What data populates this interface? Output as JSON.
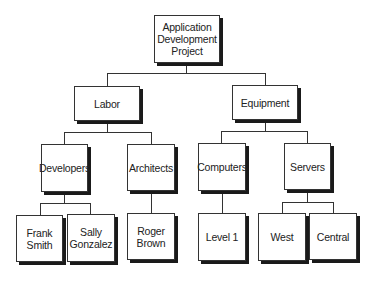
{
  "diagram": {
    "type": "org-chart",
    "root": {
      "label": "Application\nDevelopment\nProject",
      "children": [
        {
          "label": "Labor",
          "children": [
            {
              "label": "Developers",
              "children": [
                {
                  "label": "Frank\nSmith"
                },
                {
                  "label": "Sally\nGonzalez"
                }
              ]
            },
            {
              "label": "Architects",
              "children": [
                {
                  "label": "Roger\nBrown"
                }
              ]
            }
          ]
        },
        {
          "label": "Equipment",
          "children": [
            {
              "label": "Computers",
              "children": [
                {
                  "label": "Level 1"
                }
              ]
            },
            {
              "label": "Servers",
              "children": [
                {
                  "label": "West"
                },
                {
                  "label": "Central"
                }
              ]
            }
          ]
        }
      ]
    },
    "nodes": {
      "root": "Application\nDevelopment\nProject",
      "labor": "Labor",
      "equipment": "Equipment",
      "developers": "Developers",
      "architects": "Architects",
      "computers": "Computers",
      "servers": "Servers",
      "frank_smith": "Frank\nSmith",
      "sally_gonzalez": "Sally\nGonzalez",
      "roger_brown": "Roger\nBrown",
      "level1": "Level 1",
      "west": "West",
      "central": "Central"
    },
    "colors": {
      "border": "#333333",
      "shadow": "#1a1a1a",
      "background": "#ffffff",
      "text": "#222222"
    }
  }
}
